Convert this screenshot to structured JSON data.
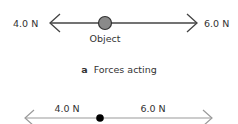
{
  "diagram_a": {
    "left_force_label": "4.0 N",
    "right_force_label": "6.0 N",
    "object_label": "Object",
    "caption_letter": "a",
    "caption_text": "Forces acting",
    "line_color": "#444444",
    "object_fill": "#8a8a8a",
    "object_stroke": "#333333"
  },
  "diagram_b": {
    "left_force_label": "4.0 N",
    "right_force_label": "6.0 N",
    "line_color": "#9a9a9a",
    "dot_color": "#000000"
  }
}
